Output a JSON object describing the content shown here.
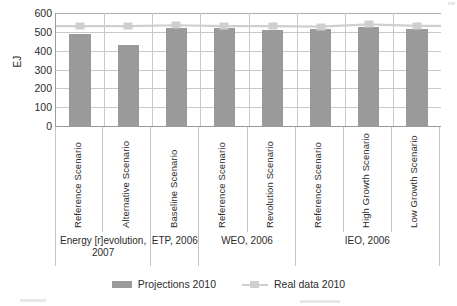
{
  "chart_data": {
    "type": "bar",
    "title": "",
    "xlabel": "",
    "ylabel": "EJ",
    "ylim": [
      0,
      600
    ],
    "yticks": [
      600,
      500,
      400,
      300,
      200,
      100,
      0
    ],
    "grid": true,
    "legend_position": "bottom",
    "categories": [
      "Reference Scenario",
      "Alternative Scenario",
      "Baseline Scenario",
      "Reference Scenario",
      "Revolution Scenario",
      "Reference Scenario",
      "High Growth Scenario",
      "Low Growth Scenario"
    ],
    "groups": [
      {
        "label": "Energy [r]evolution, 2007",
        "span": 2
      },
      {
        "label": "ETP, 2006",
        "span": 1
      },
      {
        "label": "WEO, 2006",
        "span": 2
      },
      {
        "label": "IEO, 2006",
        "span": 3
      }
    ],
    "series": [
      {
        "name": "Projections 2010",
        "type": "bar",
        "color": "#9a9a9a",
        "values": [
          487,
          428,
          520,
          523,
          512,
          516,
          525,
          517
        ]
      },
      {
        "name": "Real data 2010",
        "type": "line",
        "color": "#cfcfcf",
        "values": [
          530,
          530,
          535,
          530,
          530,
          528,
          540,
          532
        ]
      }
    ]
  },
  "axis": {
    "y_label": "EJ",
    "y_ticks": [
      "600",
      "500",
      "400",
      "300",
      "200",
      "100",
      "0"
    ]
  },
  "legend": {
    "items": [
      {
        "label": "Projections 2010",
        "type": "bar"
      },
      {
        "label": "Real data 2010",
        "type": "line"
      }
    ]
  },
  "colors": {
    "bar": "#9a9a9a",
    "line": "#cfcfcf",
    "grid": "#c9c9c9",
    "axis": "#9c9c9c",
    "text": "#2b2b2b"
  }
}
